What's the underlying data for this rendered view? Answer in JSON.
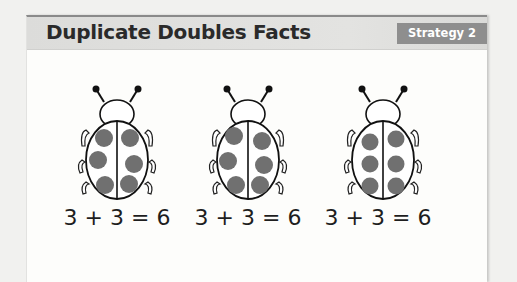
{
  "header": {
    "title": "Duplicate Doubles Facts",
    "badge": "Strategy 2"
  },
  "ladybugs": [
    {
      "left_spots": 3,
      "right_spots": 3,
      "equation": "3 + 3 = 6"
    },
    {
      "left_spots": 3,
      "right_spots": 3,
      "equation": "3 + 3 = 6"
    },
    {
      "left_spots": 3,
      "right_spots": 3,
      "equation": "3 + 3 = 6"
    }
  ],
  "colors": {
    "header_bg": "#dcdcda",
    "badge_bg": "#8e8e8e",
    "spot": "#707070"
  }
}
